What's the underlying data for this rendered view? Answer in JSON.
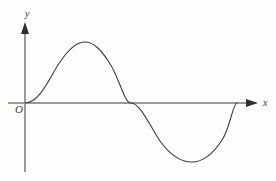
{
  "figure": {
    "background_color": "#fdfdfd",
    "axis_color": "#9a9a9a",
    "curve_color": "#3a3a3a",
    "label_color": "#3a3a3a"
  },
  "labels": {
    "y_axis": "y",
    "x_axis": "x",
    "origin": "O"
  },
  "chart_data": {
    "type": "line",
    "title": "",
    "xlabel": "x",
    "ylabel": "y",
    "origin_label": "O",
    "grid": false,
    "legend": null,
    "curve_color": "#3a3a3a",
    "axis_color": "#9a9a9a",
    "axes": {
      "x_axis_pixel_y": 103,
      "y_axis_pixel_x": 25,
      "x_axis_start_px": 8,
      "x_axis_end_px": 258,
      "y_axis_top_px": 22,
      "y_axis_bottom_px": 172,
      "x_arrow": true,
      "y_arrow": true,
      "tick_labels_x": [],
      "tick_labels_y": []
    },
    "series": [
      {
        "name": "sine curve",
        "amplitude": 61,
        "period_px": 212,
        "x_start_px": 25,
        "x_end_px": 237,
        "key_points": [
          {
            "role": "start-zero",
            "x": 25,
            "y": 103
          },
          {
            "role": "maximum",
            "x": 85,
            "y": 42
          },
          {
            "role": "mid-zero",
            "x": 131,
            "y": 103
          },
          {
            "role": "minimum",
            "x": 192,
            "y": 162
          },
          {
            "role": "end-zero",
            "x": 237,
            "y": 103
          }
        ],
        "path": "M 25 103 C 40 103 49 78 60 62 C 68 50 76 42 85 42 C 94 42 101 50 109 62 C 120 79 124 103 131 103 C 140 103 150 126 160 141 C 170 155 181 162 192 162 C 203 162 213 154 222 140 C 230 128 233 103 237 103"
      }
    ]
  }
}
